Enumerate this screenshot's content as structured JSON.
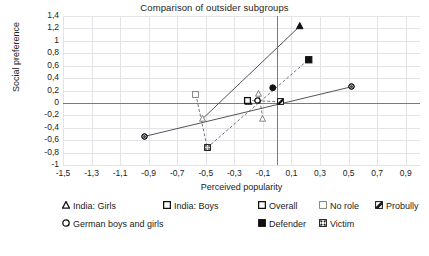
{
  "chart_data": {
    "type": "scatter",
    "title": "Comparison of outsider subgroups",
    "xlabel": "Perceived popularity",
    "ylabel": "Social preference",
    "xlim": [
      -1.5,
      1.0
    ],
    "ylim": [
      -1.0,
      1.4
    ],
    "grid": true,
    "legend_position": "bottom",
    "xticks": [
      "-1,5",
      "-1,3",
      "-1,1",
      "-0,9",
      "-0,7",
      "-0,5",
      "-0,3",
      "-0,1",
      "0,1",
      "0,3",
      "0,5",
      "0,7",
      "0,9"
    ],
    "xtick_values": [
      -1.5,
      -1.3,
      -1.1,
      -0.9,
      -0.7,
      -0.5,
      -0.3,
      -0.1,
      0.1,
      0.3,
      0.5,
      0.7,
      0.9
    ],
    "yticks": [
      "1,4",
      "1,2",
      "1",
      "0,8",
      "0,6",
      "0,4",
      "0,2",
      "0",
      "-0,2",
      "-0,4",
      "-0,6",
      "-0,8",
      "-1"
    ],
    "ytick_values": [
      1.4,
      1.2,
      1.0,
      0.8,
      0.6,
      0.4,
      0.2,
      0.0,
      -0.2,
      -0.4,
      -0.6,
      -0.8,
      -1.0
    ],
    "shape_legend": [
      {
        "key": "india-girls",
        "label": "India: Girls",
        "symbol": "triangle-open"
      },
      {
        "key": "india-boys",
        "label": "India: Boys",
        "symbol": "square-open"
      },
      {
        "key": "german-boys-and-girls",
        "label": "German boys and girls",
        "symbol": "circle-open"
      }
    ],
    "fill_legend": [
      {
        "key": "overall",
        "label": "Overall",
        "symbol": "square-outline-bold"
      },
      {
        "key": "no-role",
        "label": "No role",
        "symbol": "square-light"
      },
      {
        "key": "probully",
        "label": "Probully",
        "symbol": "square-hatched"
      },
      {
        "key": "defender",
        "label": "Defender",
        "symbol": "square-filled"
      },
      {
        "key": "victim",
        "label": "Victim",
        "symbol": "square-crosshatch"
      }
    ],
    "points": [
      {
        "group": "india-girls",
        "role": "overall",
        "x": -0.2,
        "y": 0.03,
        "shape": "triangle",
        "fill": "outline"
      },
      {
        "group": "india-girls",
        "role": "no-role",
        "x": -0.13,
        "y": 0.15,
        "shape": "triangle",
        "fill": "light"
      },
      {
        "group": "india-girls",
        "role": "probully",
        "x": -0.1,
        "y": -0.25,
        "shape": "triangle",
        "fill": "light"
      },
      {
        "group": "india-girls",
        "role": "victim",
        "x": -0.52,
        "y": -0.25,
        "shape": "triangle",
        "fill": "light"
      },
      {
        "group": "india-girls",
        "role": "defender",
        "x": 0.16,
        "y": 1.24,
        "shape": "triangle",
        "fill": "solid"
      },
      {
        "group": "india-boys",
        "role": "overall",
        "x": -0.21,
        "y": 0.04,
        "shape": "square",
        "fill": "outline"
      },
      {
        "group": "india-boys",
        "role": "no-role",
        "x": -0.57,
        "y": 0.14,
        "shape": "square",
        "fill": "light"
      },
      {
        "group": "india-boys",
        "role": "probully",
        "x": 0.02,
        "y": 0.02,
        "shape": "square",
        "fill": "hatched"
      },
      {
        "group": "india-boys",
        "role": "victim",
        "x": -0.49,
        "y": -0.72,
        "shape": "square",
        "fill": "crosshatch"
      },
      {
        "group": "india-boys",
        "role": "defender",
        "x": 0.22,
        "y": 0.7,
        "shape": "square",
        "fill": "solid"
      },
      {
        "group": "german-boys-and-girls",
        "role": "overall",
        "x": -0.14,
        "y": 0.04,
        "shape": "circle",
        "fill": "outline"
      },
      {
        "group": "german-boys-and-girls",
        "role": "probully",
        "x": -0.93,
        "y": -0.54,
        "shape": "circle",
        "fill": "hatched"
      },
      {
        "group": "german-boys-and-girls",
        "role": "victim",
        "x": 0.52,
        "y": 0.26,
        "shape": "circle",
        "fill": "hatched"
      },
      {
        "group": "german-boys-and-girls",
        "role": "defender",
        "x": -0.03,
        "y": 0.24,
        "shape": "circle",
        "fill": "solid"
      }
    ],
    "connectors": [
      {
        "from": [
          -0.93,
          -0.54
        ],
        "to": [
          0.52,
          0.26
        ],
        "style": "solid"
      },
      {
        "from": [
          -0.52,
          -0.25
        ],
        "to": [
          0.16,
          1.24
        ],
        "style": "solid"
      },
      {
        "from": [
          -0.49,
          -0.72
        ],
        "to": [
          0.22,
          0.7
        ],
        "style": "dashed"
      },
      {
        "from": [
          -0.57,
          0.14
        ],
        "to": [
          -0.49,
          -0.72
        ],
        "style": "dashed"
      },
      {
        "from": [
          -0.21,
          0.04
        ],
        "to": [
          0.02,
          0.02
        ],
        "style": "dashed"
      },
      {
        "from": [
          -0.1,
          -0.25
        ],
        "to": [
          -0.13,
          0.15
        ],
        "style": "dashed"
      }
    ]
  }
}
